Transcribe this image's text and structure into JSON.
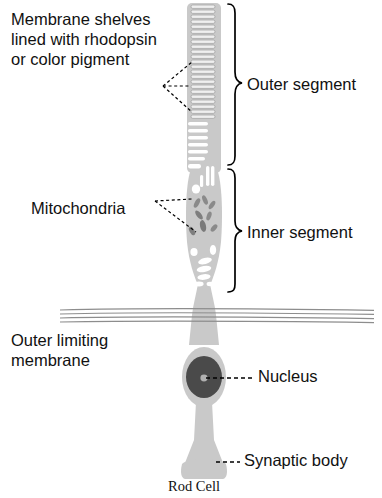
{
  "diagram": {
    "title": "Rod Cell",
    "caption": "Rod Cell",
    "labels": {
      "membrane_shelves": "Membrane shelves\nlined with rhodopsin\nor color pigment",
      "mitochondria": "Mitochondria",
      "outer_limiting_membrane": "Outer limiting\nmembrane",
      "outer_segment": "Outer segment",
      "inner_segment": "Inner segment",
      "nucleus": "Nucleus",
      "synaptic_body": "Synaptic body"
    },
    "colors": {
      "text": "#111111",
      "cytoplasm_fill": "#c9c9c9",
      "cytoplasm_outline": "#d8d8d8",
      "disc_stroke": "#9a9a9a",
      "disc_fill": "#ededed",
      "nucleus_fill": "#4a4a4a",
      "nucleolus_fill": "#b0b0b0",
      "mitochondria_fill": "#8a8a8a",
      "vacuole_fill": "#ffffff",
      "membrane_line": "#8d8d8d",
      "leader_line": "#000000",
      "brace_line": "#000000",
      "background": "#ffffff"
    },
    "structures": {
      "outer_segment_discs": 32,
      "mitochondria_count": 8,
      "vacuoles_count": 7,
      "limiting_membrane_lines": 4,
      "nucleolus": "present"
    }
  }
}
